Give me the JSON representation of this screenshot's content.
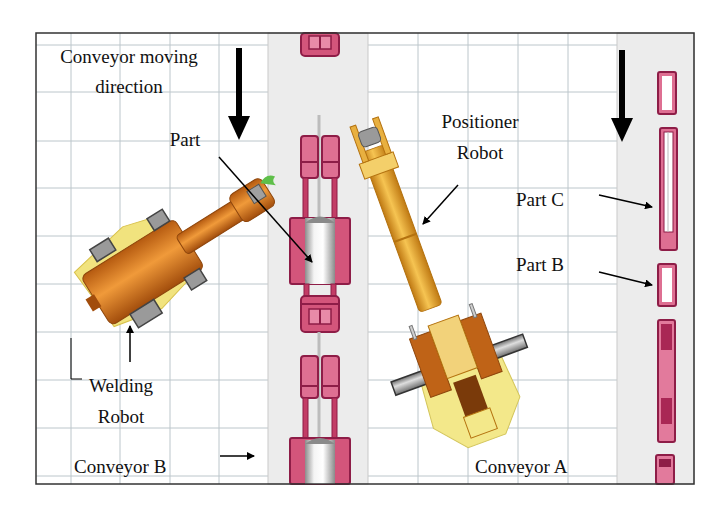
{
  "figure": {
    "type": "plan-view layout of robotic welding cell",
    "frame": {
      "x": 36,
      "y": 33,
      "width": 658,
      "height": 451,
      "border_color": "#333333"
    },
    "grid": {
      "color": "#b9c3c8",
      "cell_size": 49
    }
  },
  "conveyors": [
    {
      "id": "conveyor-b",
      "label": "Conveyor B",
      "x": 268,
      "width": 100,
      "fill": "#ececec"
    },
    {
      "id": "conveyor-a",
      "label": "Conveyor A",
      "x": 617,
      "width": 77,
      "fill": "#ececec"
    }
  ],
  "labels": {
    "conveyor_direction": {
      "line1": "Conveyor moving",
      "line2": "direction"
    },
    "part": "Part",
    "positioner_robot": {
      "line1": "Positioner",
      "line2": "Robot"
    },
    "part_c": "Part C",
    "part_b": "Part B",
    "welding_robot": {
      "line1": "Welding",
      "line2": "Robot"
    },
    "conveyor_b": "Conveyor B",
    "conveyor_a": "Conveyor A"
  },
  "colors": {
    "fixture_dark": "#9b1f4e",
    "fixture_fill": "#d9577f",
    "fixture_light": "#e98aa8",
    "robot_orange": "#d97a1e",
    "robot_orange_dark": "#a9520f",
    "robot_yellow": "#f1e27a",
    "robot_gold": "#e8a83a",
    "cylinder_gray": "#9a9a9a",
    "gripper_green": "#5fbf4a",
    "arrow": "#000000"
  }
}
